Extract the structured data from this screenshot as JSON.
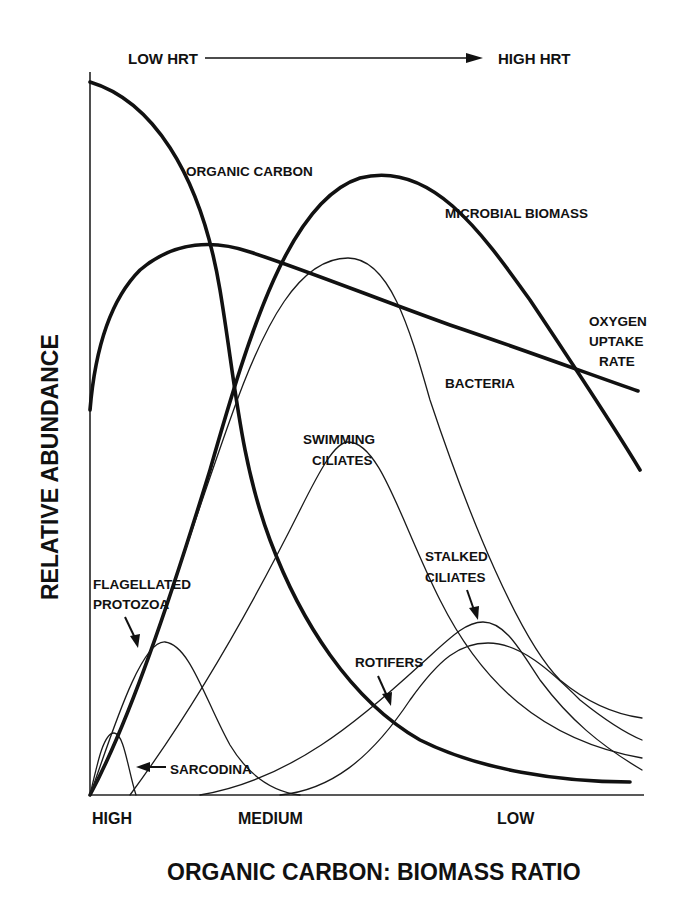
{
  "header": {
    "left_label": "LOW HRT",
    "right_label": "HIGH HRT"
  },
  "axes": {
    "y_label": "RELATIVE ABUNDANCE",
    "x_label": "ORGANIC CARBON:  BIOMASS RATIO",
    "x_ticks": [
      "HIGH",
      "MEDIUM",
      "LOW"
    ]
  },
  "curves": {
    "organic_carbon": "ORGANIC CARBON",
    "microbial_biomass": "MICROBIAL BIOMASS",
    "oxygen_uptake_1": "OXYGEN",
    "oxygen_uptake_2": "UPTAKE",
    "oxygen_uptake_3": "RATE",
    "bacteria": "BACTERIA",
    "swimming_ciliates_1": "SWIMMING",
    "swimming_ciliates_2": "CILIATES",
    "stalked_ciliates_1": "STALKED",
    "stalked_ciliates_2": "CILIATES",
    "flagellated_1": "FLAGELLATED",
    "flagellated_2": "PROTOZOA",
    "rotifers": "ROTIFERS",
    "sarcodina": "SARCODINA"
  },
  "colors": {
    "ink": "#111111",
    "background": "#ffffff"
  }
}
